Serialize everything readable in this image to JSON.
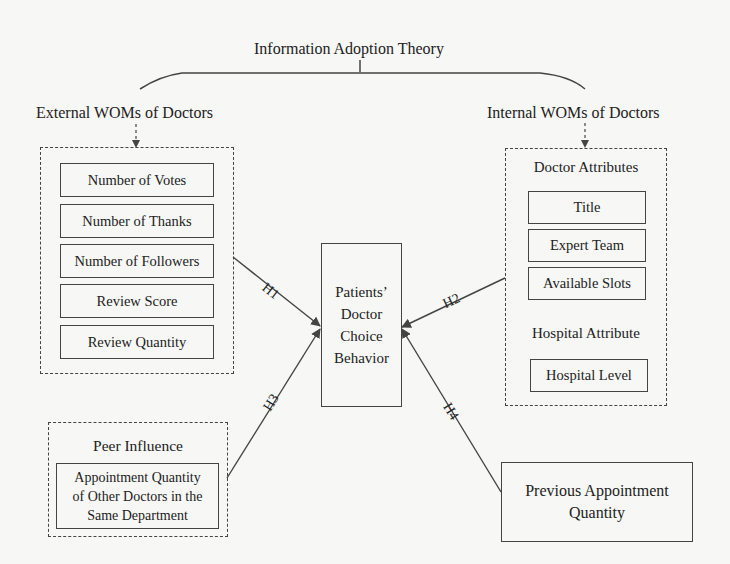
{
  "diagram": {
    "theory_title": "Information Adoption Theory",
    "external": {
      "title": "External WOMs of Doctors",
      "items": [
        "Number of Votes",
        "Number of Thanks",
        "Number of Followers",
        "Review Score",
        "Review Quantity"
      ]
    },
    "internal": {
      "title": "Internal WOMs of Doctors",
      "doctor_attributes": {
        "title": "Doctor Attributes",
        "items": [
          "Title",
          "Expert Team",
          "Available Slots"
        ]
      },
      "hospital_attribute": {
        "title": "Hospital Attribute",
        "items": [
          "Hospital Level"
        ]
      }
    },
    "outcome": {
      "lines": [
        "Patients’",
        "Doctor",
        "Choice",
        "Behavior"
      ]
    },
    "peer": {
      "title": "Peer Influence",
      "item_lines": [
        "Appointment Quantity",
        "of Other Doctors in the",
        "Same Department"
      ]
    },
    "previous": {
      "lines": [
        "Previous Appointment",
        "Quantity"
      ]
    },
    "hypotheses": [
      "H1",
      "H2",
      "H3",
      "H4"
    ],
    "colors": {
      "line": "#444444",
      "background": "#f7f7f5",
      "text": "#222222"
    }
  }
}
